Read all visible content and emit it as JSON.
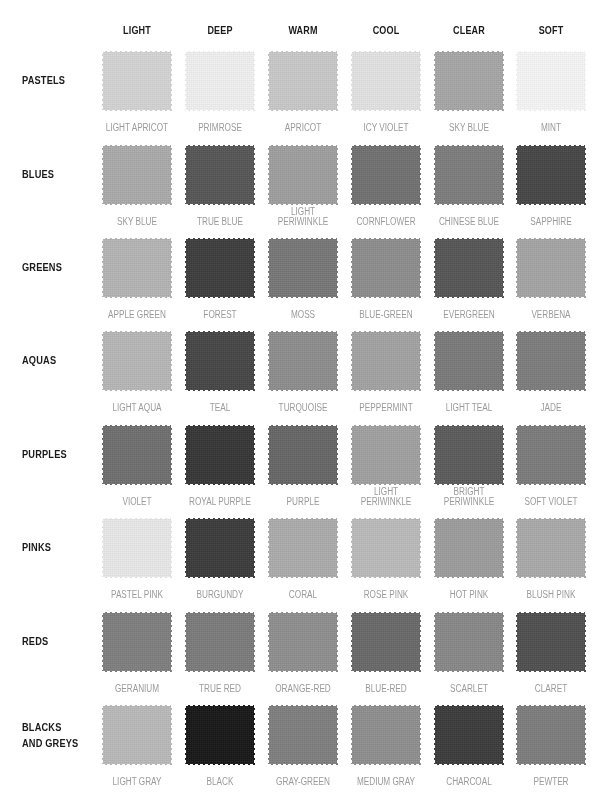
{
  "columns": [
    "LIGHT",
    "DEEP",
    "WARM",
    "COOL",
    "CLEAR",
    "SOFT"
  ],
  "rows": [
    {
      "label": "PASTELS",
      "swatches": [
        {
          "name": "LIGHT APRICOT",
          "color": "#d4d4d4"
        },
        {
          "name": "PRIMROSE",
          "color": "#f0f0f0"
        },
        {
          "name": "APRICOT",
          "color": "#c8c8c8"
        },
        {
          "name": "ICY VIOLET",
          "color": "#e2e2e2"
        },
        {
          "name": "SKY BLUE",
          "color": "#a6a6a6"
        },
        {
          "name": "MINT",
          "color": "#f6f6f6"
        }
      ]
    },
    {
      "label": "BLUES",
      "swatches": [
        {
          "name": "SKY BLUE",
          "color": "#aaaaaa"
        },
        {
          "name": "TRUE BLUE",
          "color": "#555555"
        },
        {
          "name": "LIGHT\nPERIWINKLE",
          "color": "#9e9e9e"
        },
        {
          "name": "CORNFLOWER",
          "color": "#707070"
        },
        {
          "name": "CHINESE BLUE",
          "color": "#7c7c7c"
        },
        {
          "name": "SAPPHIRE",
          "color": "#454545"
        }
      ]
    },
    {
      "label": "GREENS",
      "swatches": [
        {
          "name": "APPLE GREEN",
          "color": "#b4b4b4"
        },
        {
          "name": "FOREST",
          "color": "#3c3c3c"
        },
        {
          "name": "MOSS",
          "color": "#767676"
        },
        {
          "name": "BLUE-GREEN",
          "color": "#8c8c8c"
        },
        {
          "name": "EVERGREEN",
          "color": "#555555"
        },
        {
          "name": "VERBENA",
          "color": "#a4a4a4"
        }
      ]
    },
    {
      "label": "AQUAS",
      "swatches": [
        {
          "name": "LIGHT AQUA",
          "color": "#b6b6b6"
        },
        {
          "name": "TEAL",
          "color": "#454545"
        },
        {
          "name": "TURQUOISE",
          "color": "#8c8c8c"
        },
        {
          "name": "PEPPERMINT",
          "color": "#a2a2a2"
        },
        {
          "name": "LIGHT TEAL",
          "color": "#797979"
        },
        {
          "name": "JADE",
          "color": "#7c7c7c"
        }
      ]
    },
    {
      "label": "PURPLES",
      "swatches": [
        {
          "name": "VIOLET",
          "color": "#6e6e6e"
        },
        {
          "name": "ROYAL PURPLE",
          "color": "#353535"
        },
        {
          "name": "PURPLE",
          "color": "#656565"
        },
        {
          "name": "LIGHT\nPERIWINKLE",
          "color": "#a0a0a0"
        },
        {
          "name": "BRIGHT\nPERIWINKLE",
          "color": "#5a5a5a"
        },
        {
          "name": "SOFT VIOLET",
          "color": "#7a7a7a"
        }
      ]
    },
    {
      "label": "PINKS",
      "swatches": [
        {
          "name": "PASTEL PINK",
          "color": "#e8e8e8"
        },
        {
          "name": "BURGUNDY",
          "color": "#3a3a3a"
        },
        {
          "name": "CORAL",
          "color": "#ababab"
        },
        {
          "name": "ROSE PINK",
          "color": "#bababa"
        },
        {
          "name": "HOT PINK",
          "color": "#9c9c9c"
        },
        {
          "name": "BLUSH PINK",
          "color": "#a9a9a9"
        }
      ]
    },
    {
      "label": "REDS",
      "swatches": [
        {
          "name": "GERANIUM",
          "color": "#7e7e7e"
        },
        {
          "name": "TRUE RED",
          "color": "#7a7a7a"
        },
        {
          "name": "ORANGE-RED",
          "color": "#8e8e8e"
        },
        {
          "name": "BLUE-RED",
          "color": "#686868"
        },
        {
          "name": "SCARLET",
          "color": "#878787"
        },
        {
          "name": "CLARET",
          "color": "#4e4e4e"
        }
      ]
    },
    {
      "label": "BLACKS\nAND GREYS",
      "swatches": [
        {
          "name": "LIGHT GRAY",
          "color": "#b9b9b9"
        },
        {
          "name": "BLACK",
          "color": "#161616"
        },
        {
          "name": "GRAY-GREEN",
          "color": "#7e7e7e"
        },
        {
          "name": "MEDIUM GRAY",
          "color": "#8e8e8e"
        },
        {
          "name": "CHARCOAL",
          "color": "#3a3a3a"
        },
        {
          "name": "PEWTER",
          "color": "#7c7c7c"
        }
      ]
    }
  ],
  "colors": {
    "header_text": "#1a1a1a",
    "swatch_label_text": "#9a9a9a",
    "background": "#ffffff"
  }
}
